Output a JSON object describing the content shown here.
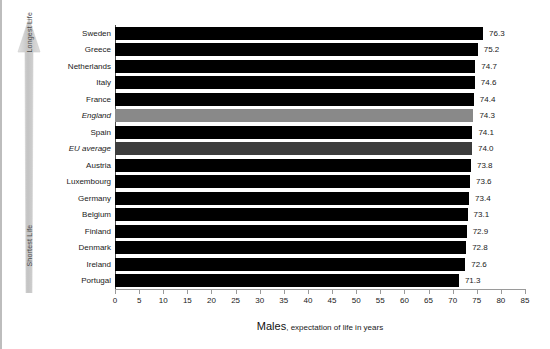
{
  "chart_data": {
    "type": "bar",
    "orientation": "horizontal",
    "title": "",
    "xlabel_lead": "Males",
    "xlabel_rest": ", expectation of life in years",
    "xlabel": "Males, expectation of life in years",
    "ylabel": "",
    "xlim": [
      0,
      85
    ],
    "xticks": [
      0,
      5,
      10,
      15,
      20,
      25,
      30,
      35,
      40,
      45,
      50,
      55,
      60,
      65,
      70,
      75,
      80,
      85
    ],
    "xtick_labels": [
      "0",
      "5",
      "10",
      "15",
      "20",
      "25",
      "30",
      "35",
      "40",
      "45",
      "50",
      "55",
      "60",
      "65",
      "70",
      "75",
      "80",
      "85"
    ],
    "grid": false,
    "legend": "none",
    "categories": [
      "Sweden",
      "Greece",
      "Netherlands",
      "Italy",
      "France",
      "England",
      "Spain",
      "EU average",
      "Austria",
      "Luxembourg",
      "Germany",
      "Belgium",
      "Finland",
      "Denmark",
      "Ireland",
      "Portugal"
    ],
    "values": [
      76.3,
      75.2,
      74.7,
      74.6,
      74.4,
      74.3,
      74.1,
      74.0,
      73.8,
      73.6,
      73.4,
      73.1,
      72.9,
      72.8,
      72.6,
      71.3
    ],
    "value_labels": [
      "76.3",
      "75.2",
      "74.7",
      "74.6",
      "74.4",
      "74.3",
      "74.1",
      "74.0",
      "73.8",
      "73.6",
      "73.4",
      "73.1",
      "72.9",
      "72.8",
      "72.6",
      "71.3"
    ],
    "bar_styles": [
      "dark",
      "dark",
      "dark",
      "dark",
      "dark",
      "light",
      "dark",
      "mid",
      "dark",
      "dark",
      "dark",
      "dark",
      "dark",
      "dark",
      "dark",
      "dark"
    ],
    "emphasized_categories": [
      "England",
      "EU average"
    ],
    "colors": {
      "bar_dark": "#000000",
      "bar_light": "#898989",
      "bar_mid": "#3d3d3d",
      "axis": "#9a9a9a",
      "text": "#1a1a1a",
      "arrow": "#c9c9c9"
    }
  },
  "annotations": {
    "arrow_top_label": "Longest Life",
    "arrow_bottom_label": "Shortest Life"
  }
}
